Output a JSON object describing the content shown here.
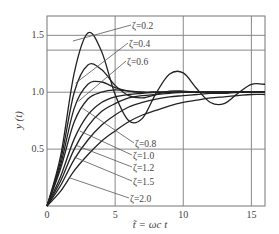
{
  "chart_data": {
    "type": "line",
    "title": "",
    "xlabel": "̃t = ωc t",
    "ylabel": "y (t)",
    "xlim": [
      0,
      16
    ],
    "ylim": [
      0,
      1.67
    ],
    "grid": true,
    "x_ticks": [
      0,
      5,
      10,
      15
    ],
    "x_tick_labels": [
      "0",
      "5",
      "10",
      "15"
    ],
    "y_ticks": [
      0.5,
      1.0,
      1.5
    ],
    "y_tick_labels": [
      "0.5",
      "1.0",
      "1.5"
    ],
    "extra_hlines": [
      1.37
    ],
    "x": [
      0,
      1,
      2,
      3,
      4,
      5,
      6,
      7,
      8,
      9,
      10,
      11,
      12,
      13,
      14,
      15,
      16
    ],
    "series": [
      {
        "name": "ζ=0.2",
        "values": [
          0,
          0.44,
          1.17,
          1.52,
          1.36,
          0.98,
          0.75,
          0.77,
          0.99,
          1.16,
          1.17,
          1.03,
          0.91,
          0.9,
          0.99,
          1.07,
          1.07
        ]
      },
      {
        "name": "ζ=0.4",
        "values": [
          0,
          0.4,
          1.0,
          1.24,
          1.2,
          1.06,
          0.97,
          0.95,
          0.98,
          1.01,
          1.01,
          1.0,
          1.0,
          1.0,
          1.0,
          1.0,
          1.0
        ]
      },
      {
        "name": "ζ=0.6",
        "values": [
          0,
          0.36,
          0.86,
          1.07,
          1.09,
          1.04,
          1.01,
          1.0,
          1.0,
          1.0,
          1.0,
          1.0,
          1.0,
          1.0,
          1.0,
          1.0,
          1.0
        ]
      },
      {
        "name": "ζ=0.8",
        "values": [
          0,
          0.33,
          0.74,
          0.94,
          1.0,
          1.02,
          1.01,
          1.0,
          1.0,
          1.0,
          1.0,
          1.0,
          1.0,
          1.0,
          1.0,
          1.0,
          1.0
        ]
      },
      {
        "name": "ζ=1.0",
        "values": [
          0,
          0.26,
          0.59,
          0.8,
          0.91,
          0.96,
          0.98,
          0.99,
          1.0,
          1.0,
          1.0,
          1.0,
          1.0,
          1.0,
          1.0,
          1.0,
          1.0
        ]
      },
      {
        "name": "ζ=1.2",
        "values": [
          0,
          0.22,
          0.5,
          0.7,
          0.83,
          0.9,
          0.95,
          0.97,
          0.98,
          0.99,
          1.0,
          1.0,
          1.0,
          1.0,
          1.0,
          1.0,
          1.0
        ]
      },
      {
        "name": "ζ=1.5",
        "values": [
          0,
          0.18,
          0.41,
          0.58,
          0.71,
          0.8,
          0.87,
          0.91,
          0.94,
          0.96,
          0.97,
          0.98,
          0.99,
          0.99,
          1.0,
          1.0,
          1.0
        ]
      },
      {
        "name": "ζ=2.0",
        "values": [
          0,
          0.13,
          0.31,
          0.45,
          0.57,
          0.66,
          0.74,
          0.8,
          0.84,
          0.88,
          0.91,
          0.93,
          0.95,
          0.96,
          0.97,
          0.98,
          0.98
        ]
      }
    ],
    "annotations": [
      {
        "text": "ζ=0.2",
        "x": 132,
        "y": 29
      },
      {
        "text": "ζ=0.4",
        "x": 129,
        "y": 47
      },
      {
        "text": "ζ=0.6",
        "x": 127,
        "y": 65
      },
      {
        "text": "ζ=0.8",
        "x": 135,
        "y": 147
      },
      {
        "text": "ζ=1.0",
        "x": 133,
        "y": 159
      },
      {
        "text": "ζ=1.2",
        "x": 133,
        "y": 171
      },
      {
        "text": "ζ=1.5",
        "x": 133,
        "y": 185
      },
      {
        "text": "ζ=2.0",
        "x": 130,
        "y": 202
      }
    ]
  }
}
